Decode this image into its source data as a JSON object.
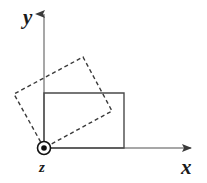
{
  "figure": {
    "type": "diagram",
    "canvas": {
      "width": 207,
      "height": 183,
      "background": "#ffffff"
    },
    "colors": {
      "axis": "#8a8a8a",
      "solid_shape": "#4a4a4a",
      "dashed_shape": "#3a3a3a",
      "label": "#1a1a1a",
      "marker": "#111111"
    },
    "axes": {
      "origin": {
        "x": 44,
        "y": 148
      },
      "y_axis": {
        "label": "y",
        "label_pos": {
          "x": 23,
          "y": 22
        },
        "from": {
          "x": 44,
          "y": 148
        },
        "to": {
          "x": 44,
          "y": 14
        },
        "arrow": "up"
      },
      "x_axis": {
        "label": "x",
        "label_pos": {
          "x": 182,
          "y": 172
        },
        "from": {
          "x": 44,
          "y": 148
        },
        "to": {
          "x": 191,
          "y": 148
        },
        "arrow": "right"
      },
      "z_axis": {
        "label": "z",
        "label_pos": {
          "x": 40,
          "y": 170
        },
        "marker": "out-of-page-dot",
        "marker_center": {
          "x": 44,
          "y": 148
        },
        "marker_outer_radius": 7,
        "marker_inner_radius": 3
      }
    },
    "shapes": [
      {
        "name": "original-rectangle",
        "style": "solid",
        "stroke": "#4a4a4a",
        "stroke_width": 1.4,
        "points": [
          {
            "x": 44,
            "y": 93
          },
          {
            "x": 124,
            "y": 93
          },
          {
            "x": 124,
            "y": 148
          },
          {
            "x": 44,
            "y": 148
          }
        ]
      },
      {
        "name": "rotated-rectangle",
        "style": "dashed",
        "stroke": "#3a3a3a",
        "stroke_width": 1.4,
        "dash_pattern": "4 3",
        "rotation_degrees": 34,
        "points": [
          {
            "x": 44,
            "y": 148
          },
          {
            "x": 14,
            "y": 94
          },
          {
            "x": 83,
            "y": 57
          },
          {
            "x": 112,
            "y": 111
          }
        ]
      }
    ]
  }
}
